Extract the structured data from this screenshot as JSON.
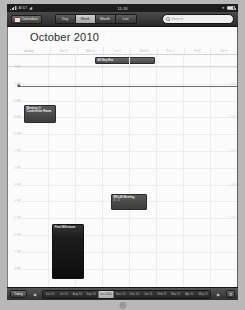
{
  "status_bar": {
    "carrier": "AT&T",
    "wifi_icon": "wifi-icon",
    "time": "11:18",
    "battery_icon": "battery-icon",
    "bluetooth_icon": "bluetooth-icon"
  },
  "toolbar": {
    "calendars_label": "Calendars",
    "calendars_icon": "calendar-icon",
    "views": [
      {
        "label": "Day",
        "active": false
      },
      {
        "label": "Week",
        "active": true
      },
      {
        "label": "Month",
        "active": false
      },
      {
        "label": "List",
        "active": false
      }
    ],
    "search": {
      "placeholder": "Search",
      "value": "",
      "icon": "search-icon"
    }
  },
  "calendar": {
    "title": "October 2010",
    "day_columns": [
      "all-day",
      "Sun 3",
      "Mon 4",
      "Tue 5",
      "Wed 6",
      "Thu 7",
      "Fri 8",
      "Sat 9"
    ],
    "hour_labels": [
      "8 AM",
      "9 AM",
      "10 AM",
      "11 AM",
      "12 PM",
      "1 PM",
      "2 PM",
      "3 PM",
      "4 PM",
      "5 PM",
      "6 PM",
      "7 PM",
      "8 PM"
    ],
    "now_indicator": {
      "label": "11:18",
      "visible": true
    },
    "events": [
      {
        "title": "All Day Rec",
        "time": "",
        "all_day": true,
        "column": 3,
        "style": "allday"
      },
      {
        "title": "Meeting @ Conference Room",
        "time": "10 AM",
        "all_day": false,
        "column": 1,
        "style": "normal"
      },
      {
        "title": "RKL08 Meeting",
        "time": "3 - 4",
        "all_day": false,
        "column": 4,
        "style": "normal"
      },
      {
        "title": "Final Milestone",
        "time": "",
        "all_day": false,
        "column": 2,
        "style": "tall"
      }
    ]
  },
  "bottom_bar": {
    "today_label": "Today",
    "prev_icon": "chevron-left-icon",
    "next_icon": "chevron-right-icon",
    "trash_icon": "trash-icon",
    "months": [
      {
        "label": "Jun 10",
        "selected": false
      },
      {
        "label": "Jul 10",
        "selected": false
      },
      {
        "label": "Aug 10",
        "selected": false
      },
      {
        "label": "Sep 10",
        "selected": false
      },
      {
        "label": "Oct 2010",
        "selected": true
      },
      {
        "label": "Nov 10",
        "selected": false
      },
      {
        "label": "Dec 10",
        "selected": false
      },
      {
        "label": "Jan 11",
        "selected": false
      },
      {
        "label": "Feb 11",
        "selected": false
      },
      {
        "label": "Mar 11",
        "selected": false
      },
      {
        "label": "Apr 11",
        "selected": false
      },
      {
        "label": "May 11",
        "selected": false
      }
    ]
  },
  "home_button": "home-button"
}
